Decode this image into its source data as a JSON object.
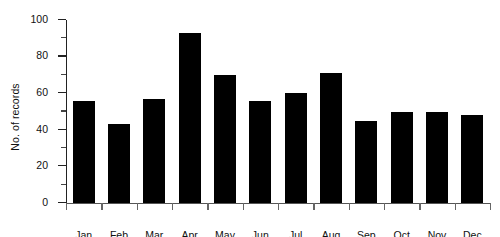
{
  "chart_data": {
    "type": "bar",
    "title": "",
    "subtitle": "",
    "xlabel": "",
    "ylabel": "No. of records",
    "categories": [
      "Jan",
      "Feb",
      "Mar",
      "Apr",
      "May",
      "Jun",
      "Jul",
      "Aug",
      "Sep",
      "Oct",
      "Nov",
      "Dec"
    ],
    "values": [
      56,
      43,
      57,
      93,
      70,
      56,
      60,
      71,
      45,
      50,
      50,
      48
    ],
    "ylim": [
      0,
      100
    ],
    "y_major_ticks": [
      0,
      20,
      40,
      60,
      80,
      100
    ],
    "y_minor_ticks": [
      10,
      30,
      50,
      70,
      90
    ],
    "y_tick_labels": [
      "0",
      "20",
      "40",
      "60",
      "80",
      "100"
    ],
    "grid": false,
    "legend": false,
    "legend_position": "none",
    "bar_color": "#000000",
    "background_color": "#ffffff",
    "axis_color": "#222222"
  },
  "artifacts": {
    "top_cutoff_text": "· ·  ·   · ·    ·"
  }
}
